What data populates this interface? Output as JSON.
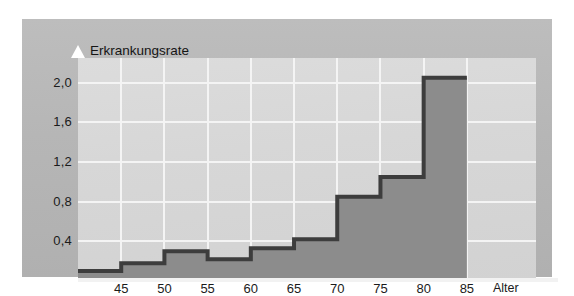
{
  "chart_data": {
    "type": "area",
    "title_line1": "Erkrankungsrate",
    "title_line2": "in %",
    "ylabel": "Erkrankungsrate in %",
    "xlabel": "Alter",
    "xlabel_caption": "Alter",
    "ytick_labels": [
      "2,0",
      "1,6",
      "1,2",
      "0,8",
      "0,4"
    ],
    "ytick_values": [
      2.0,
      1.6,
      1.2,
      0.8,
      0.4
    ],
    "xtick_labels": [
      "45",
      "50",
      "55",
      "60",
      "65",
      "70",
      "75",
      "80",
      "85"
    ],
    "xtick_values": [
      45,
      50,
      55,
      60,
      65,
      70,
      75,
      80,
      85
    ],
    "ylim": [
      0,
      2.25
    ],
    "xlim": [
      40,
      93
    ],
    "grid": true,
    "legend": "none",
    "x_bin_edges": [
      40,
      45,
      50,
      55,
      60,
      65,
      70,
      75,
      80,
      85
    ],
    "categories": [
      "40-45",
      "45-50",
      "50-55",
      "55-60",
      "60-65",
      "65-70",
      "70-75",
      "75-80",
      "80-85"
    ],
    "values": [
      0.1,
      0.18,
      0.3,
      0.22,
      0.33,
      0.42,
      0.85,
      1.05,
      2.05
    ],
    "series": [
      {
        "name": "Erkrankungsrate in %",
        "values": [
          0.1,
          0.18,
          0.3,
          0.22,
          0.33,
          0.42,
          0.85,
          1.05,
          2.05
        ]
      }
    ],
    "colors": {
      "area_fill": "#8c8c8c",
      "area_outline": "#3d3d3d",
      "plot_background": "#d7d7d7",
      "frame_background": "#b6b6b6",
      "gridline": "#f4f4f4",
      "axis_arrow": "#ffffff",
      "text": "#1b1b1b"
    }
  }
}
